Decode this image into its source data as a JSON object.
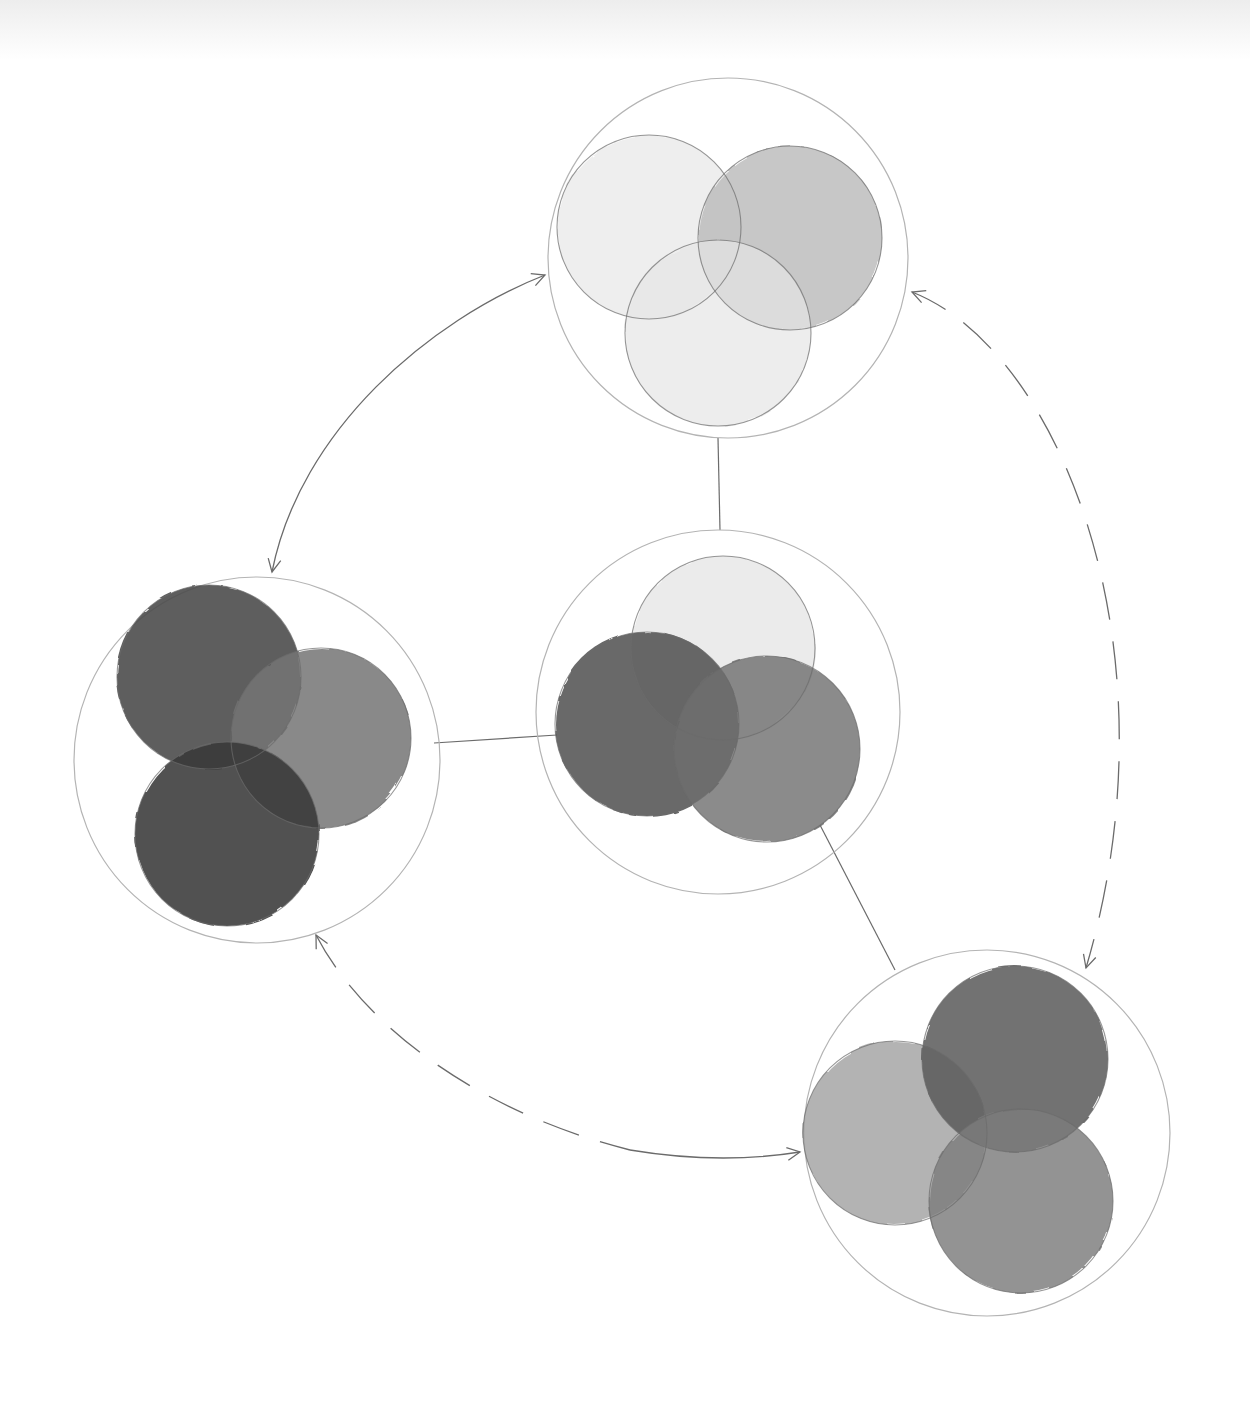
{
  "diagram": {
    "type": "hand-drawn pencil and watercolor cycle diagram",
    "colors": {
      "paper": "#ffffff",
      "pencil_line": "#6b6b6b",
      "outer_ring": "#b4b4b4"
    },
    "nodes": [
      {
        "id": "top",
        "outer": {
          "cx": 728,
          "cy": 258,
          "r": 180
        },
        "circles": [
          {
            "cx": 649,
            "cy": 227,
            "r": 92,
            "fill": "#e8e8e8",
            "opacity": 0.75
          },
          {
            "cx": 790,
            "cy": 238,
            "r": 92,
            "fill": "#b9b9b9",
            "opacity": 0.8
          },
          {
            "cx": 718,
            "cy": 333,
            "r": 93,
            "fill": "#e6e6e6",
            "opacity": 0.7
          }
        ]
      },
      {
        "id": "center",
        "outer": {
          "cx": 718,
          "cy": 712,
          "r": 182
        },
        "circles": [
          {
            "cx": 723,
            "cy": 648,
            "r": 92,
            "fill": "#e3e3e3",
            "opacity": 0.7
          },
          {
            "cx": 647,
            "cy": 724,
            "r": 92,
            "fill": "#4f4f4f",
            "opacity": 0.85
          },
          {
            "cx": 767,
            "cy": 749,
            "r": 93,
            "fill": "#6e6e6e",
            "opacity": 0.8
          }
        ]
      },
      {
        "id": "left",
        "outer": {
          "cx": 257,
          "cy": 760,
          "r": 183
        },
        "circles": [
          {
            "cx": 209,
            "cy": 677,
            "r": 92,
            "fill": "#4c4c4c",
            "opacity": 0.9
          },
          {
            "cx": 321,
            "cy": 738,
            "r": 90,
            "fill": "#747474",
            "opacity": 0.85
          },
          {
            "cx": 227,
            "cy": 834,
            "r": 92,
            "fill": "#383838",
            "opacity": 0.88
          }
        ]
      },
      {
        "id": "bottom-right",
        "outer": {
          "cx": 987,
          "cy": 1133,
          "r": 183
        },
        "circles": [
          {
            "cx": 895,
            "cy": 1133,
            "r": 92,
            "fill": "#a6a6a6",
            "opacity": 0.85
          },
          {
            "cx": 1015,
            "cy": 1059,
            "r": 93,
            "fill": "#5a5a5a",
            "opacity": 0.85
          },
          {
            "cx": 1021,
            "cy": 1201,
            "r": 92,
            "fill": "#7c7c7c",
            "opacity": 0.82
          }
        ]
      }
    ],
    "connectors": [
      {
        "id": "top-to-center",
        "d": "M718 438 L720 530",
        "style": "solid"
      },
      {
        "id": "center-to-left",
        "d": "M557 735 L434 743",
        "style": "solid"
      },
      {
        "id": "center-to-bottom-right",
        "d": "M820 825 L895 970",
        "style": "solid"
      }
    ],
    "cycle_arrows": [
      {
        "id": "arc-top-left",
        "d": "M545 275 C 430 320, 300 430, 272 572",
        "style": "solid",
        "heads": [
          "start",
          "end"
        ]
      },
      {
        "id": "arc-top-right-dashed",
        "d": "M912 292 C 1060 350, 1180 650, 1086 968",
        "style": "dashed",
        "heads": [
          "start",
          "end"
        ]
      },
      {
        "id": "arc-left-bottom-dashed",
        "d": "M316 935 C 360 1020, 470 1110, 630 1150",
        "style": "dashed",
        "heads": [
          "start"
        ]
      },
      {
        "id": "arc-to-bottom-right",
        "d": "M630 1150 C 690 1160, 750 1160, 800 1152",
        "style": "solid",
        "heads": [
          "end"
        ]
      }
    ]
  }
}
